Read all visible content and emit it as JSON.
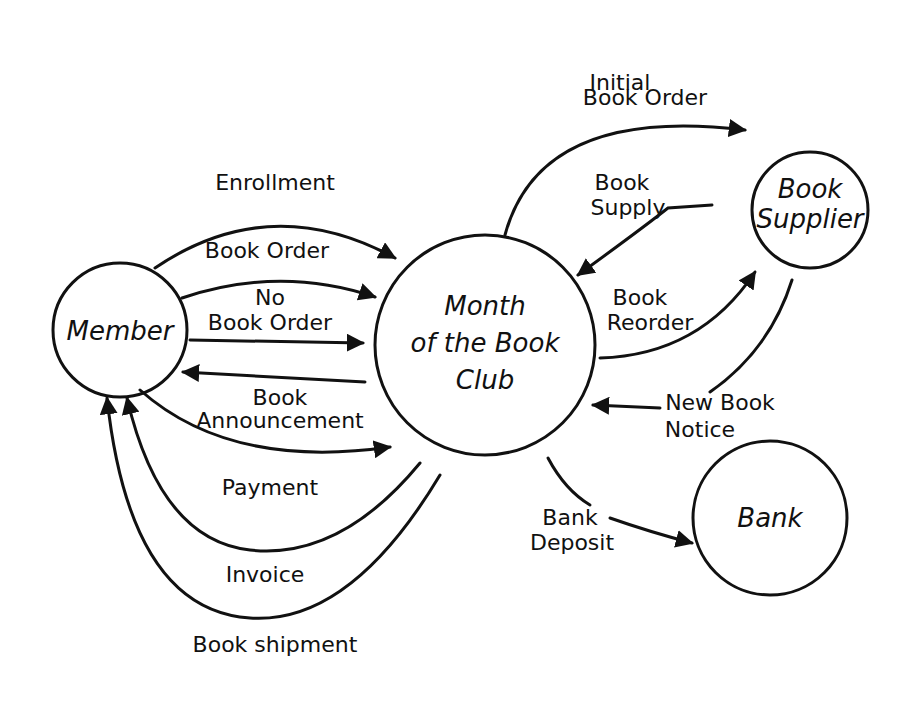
{
  "diagram": {
    "type": "data-flow-diagram",
    "style": "hand-drawn",
    "nodes": [
      {
        "id": "member",
        "label": "Member"
      },
      {
        "id": "club",
        "label_lines": [
          "Month",
          "of the Book",
          "Club"
        ]
      },
      {
        "id": "supplier",
        "label_lines": [
          "Book",
          "Supplier"
        ]
      },
      {
        "id": "bank",
        "label": "Bank"
      }
    ],
    "flows": [
      {
        "label": "Enrollment",
        "from": "Member",
        "to": "Month of the Book Club"
      },
      {
        "label": "Book Order",
        "from": "Member",
        "to": "Month of the Book Club"
      },
      {
        "label_lines": [
          "No",
          "Book Order"
        ],
        "from": "Member",
        "to": "Month of the Book Club"
      },
      {
        "label_lines": [
          "Book",
          "Announcement"
        ],
        "from": "Month of the Book Club",
        "to": "Member"
      },
      {
        "label": "Payment",
        "from": "Member",
        "to": "Month of the Book Club"
      },
      {
        "label": "Invoice",
        "from": "Month of the Book Club",
        "to": "Member"
      },
      {
        "label": "Book shipment",
        "from": "Month of the Book Club",
        "to": "Member"
      },
      {
        "label_lines": [
          "Initial",
          "Book Order"
        ],
        "from": "Month of the Book Club",
        "to": "Book Supplier"
      },
      {
        "label_lines": [
          "Book",
          "Supply"
        ],
        "from": "Book Supplier",
        "to": "Month of the Book Club"
      },
      {
        "label_lines": [
          "Book",
          "Reorder"
        ],
        "from": "Month of the Book Club",
        "to": "Book Supplier"
      },
      {
        "label_lines": [
          "New Book",
          "Notice"
        ],
        "from": "Book Supplier",
        "to": "Month of the Book Club"
      },
      {
        "label_lines": [
          "Bank",
          "Deposit"
        ],
        "from": "Month of the Book Club",
        "to": "Bank"
      }
    ]
  }
}
